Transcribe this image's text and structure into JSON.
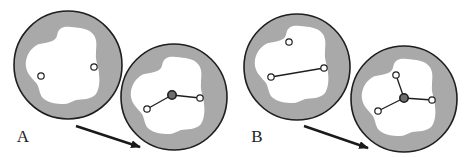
{
  "figure": {
    "panels": [
      {
        "label": "A",
        "label_pos": [
          23,
          142
        ],
        "arrow": {
          "from": [
            76,
            126
          ],
          "to": [
            140,
            147
          ]
        },
        "cavities": [
          {
            "name": "initial",
            "center": [
              68,
              65
            ],
            "radius": 54,
            "atoms": [
              [
                41,
                76
              ],
              [
                94,
                67
              ]
            ],
            "central_atom": null,
            "bonds": []
          },
          {
            "name": "final",
            "center": [
              174,
              97
            ],
            "radius": 53,
            "atoms": [
              [
                147,
                109
              ],
              [
                200,
                98
              ]
            ],
            "central_atom": [
              172,
              95
            ],
            "bonds": [
              [
                [
                  172,
                  95
                ],
                [
                  147,
                  109
                ]
              ],
              [
                [
                  172,
                  95
                ],
                [
                  200,
                  98
                ]
              ]
            ]
          }
        ]
      },
      {
        "label": "B",
        "label_pos": [
          257,
          142
        ],
        "arrow": {
          "from": [
            304,
            126
          ],
          "to": [
            368,
            148
          ]
        },
        "cavities": [
          {
            "name": "initial",
            "center": [
              297,
              67
            ],
            "radius": 53,
            "atoms": [
              [
                289,
                42
              ],
              [
                271,
                77
              ],
              [
                324,
                68
              ]
            ],
            "central_atom": null,
            "bonds": [
              [
                [
                  271,
                  77
                ],
                [
                  324,
                  68
                ]
              ]
            ]
          },
          {
            "name": "final",
            "center": [
              404,
              99
            ],
            "radius": 53,
            "atoms": [
              [
                396,
                75
              ],
              [
                378,
                111
              ],
              [
                432,
                100
              ]
            ],
            "central_atom": [
              404,
              98
            ],
            "bonds": [
              [
                [
                  404,
                  98
                ],
                [
                  396,
                  75
                ]
              ],
              [
                [
                  404,
                  98
                ],
                [
                  378,
                  111
                ]
              ],
              [
                [
                  404,
                  98
                ],
                [
                  432,
                  100
                ]
              ]
            ]
          }
        ]
      }
    ],
    "colors": {
      "background": "#ffffff",
      "matrix_fill": "#a9a9a9",
      "outline": "#1e1e1e",
      "cavity_fill": "#ffffff",
      "atom_fill": "#ffffff",
      "central_atom_fill": "#6e6e6e",
      "arrow": "#1a1a1a"
    }
  }
}
